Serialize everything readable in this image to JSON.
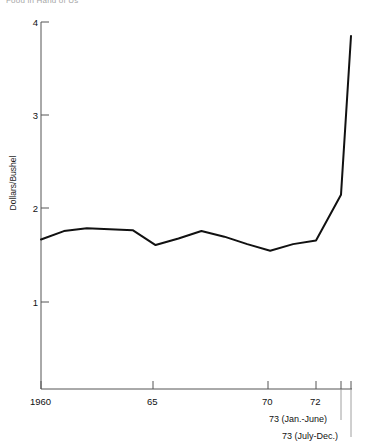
{
  "figure": {
    "title": "Food in Hand of Us"
  },
  "axes": {
    "y_axis_label": "Dollars/Bushel",
    "y_ticks": [
      "1",
      "2",
      "3",
      "4"
    ],
    "x_ticks": [
      "1960",
      "65",
      "70",
      "72"
    ],
    "annotations": [
      "73 (Jan.-June)",
      "73 (July-Dec.)"
    ]
  },
  "colors": {
    "line": "#111111",
    "axis": "#555555",
    "background": "#ffffff"
  },
  "chart_data": {
    "type": "line",
    "title": "Food in Hand of Us",
    "xlabel": "",
    "ylabel": "Dollars/Bushel",
    "ylim": [
      0,
      4
    ],
    "xlim": [
      1960,
      1973.5
    ],
    "grid": false,
    "legend": null,
    "x": [
      1960,
      1961,
      1962,
      1963,
      1964,
      1965,
      1966,
      1967,
      1968,
      1969,
      1970,
      1971,
      1972,
      1973.0,
      1973.5
    ],
    "x_tick_values": [
      1960,
      1965,
      1970,
      1972,
      1973.0,
      1973.5
    ],
    "x_tick_labels": [
      "1960",
      "65",
      "70",
      "72",
      "73 (Jan.-June)",
      "73 (July-Dec.)"
    ],
    "values": [
      1.67,
      1.76,
      1.79,
      1.78,
      1.77,
      1.61,
      1.68,
      1.76,
      1.7,
      1.62,
      1.55,
      1.62,
      1.66,
      2.15,
      3.85
    ],
    "series": [
      {
        "name": "Wheat price",
        "values": [
          1.67,
          1.76,
          1.79,
          1.78,
          1.77,
          1.61,
          1.68,
          1.76,
          1.7,
          1.62,
          1.55,
          1.62,
          1.66,
          2.15,
          3.85
        ]
      }
    ]
  }
}
